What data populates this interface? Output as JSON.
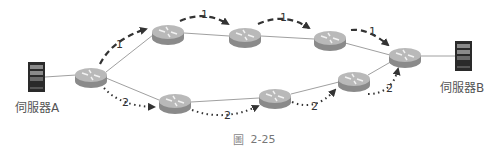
{
  "servers": [
    {
      "id": "server-a",
      "label": "伺服器A"
    },
    {
      "id": "server-b",
      "label": "伺服器B"
    }
  ],
  "paths": [
    {
      "id": "path-1",
      "label": "1",
      "style": "dashed",
      "segments": 4
    },
    {
      "id": "path-2",
      "label": "2",
      "style": "dotted",
      "segments": 4
    }
  ],
  "edge_labels": {
    "p1": [
      "1",
      "1",
      "1",
      "1"
    ],
    "p2": [
      "2",
      "2",
      "2",
      "2"
    ]
  },
  "routers": {
    "count": 8
  },
  "caption": {
    "prefix": "圖",
    "text": "2-25"
  },
  "colors": {
    "link": "#9a9a9a",
    "router_top": "#b9b9b9",
    "router_side": "#8a8a8a",
    "arrow": "#333333",
    "server_body": "#2a2a2a"
  }
}
